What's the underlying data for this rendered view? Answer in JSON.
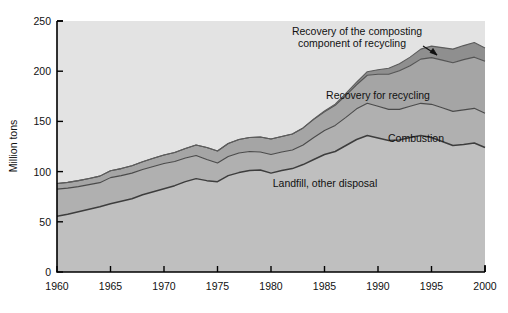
{
  "chart_data": {
    "type": "area",
    "stacked": true,
    "title": "",
    "subtitle": "",
    "xlabel": "",
    "ylabel": "Million tons",
    "xlim": [
      1960,
      2000
    ],
    "ylim": [
      0,
      250
    ],
    "grid": false,
    "legend_position": "inline-annotations",
    "x": [
      1960,
      1961,
      1962,
      1963,
      1964,
      1965,
      1966,
      1967,
      1968,
      1969,
      1970,
      1971,
      1972,
      1973,
      1974,
      1975,
      1976,
      1977,
      1978,
      1979,
      1980,
      1981,
      1982,
      1983,
      1984,
      1985,
      1986,
      1987,
      1988,
      1989,
      1990,
      1991,
      1992,
      1993,
      1994,
      1995,
      1996,
      1997,
      1998,
      1999,
      2000
    ],
    "x_ticks": [
      1960,
      1965,
      1970,
      1975,
      1980,
      1985,
      1990,
      1995,
      2000
    ],
    "x_tick_labels": [
      "1960",
      "1965",
      "1970",
      "1975",
      "1980",
      "1985",
      "1990",
      "1995",
      "2000"
    ],
    "y_ticks": [
      0,
      50,
      100,
      150,
      200,
      250
    ],
    "y_tick_labels": [
      "0",
      "50",
      "100",
      "150",
      "200",
      "250"
    ],
    "series": [
      {
        "name": "Landfill, other disposal",
        "label": "Landfill, other disposal",
        "color": "#bfbfbf",
        "line_color": "#3d3d3d",
        "values": [
          55.5,
          57.5,
          60.0,
          62.5,
          65.0,
          68.0,
          70.5,
          73.0,
          77.0,
          80.0,
          83.0,
          86.0,
          90.0,
          93.0,
          91.0,
          90.0,
          96.0,
          99.0,
          101.0,
          101.5,
          98.5,
          101.0,
          103.0,
          107.0,
          112.0,
          117.0,
          120.0,
          126.0,
          132.0,
          136.0,
          133.5,
          131.0,
          131.5,
          134.0,
          136.0,
          134.0,
          130.0,
          126.0,
          127.0,
          128.5,
          124.0
        ]
      },
      {
        "name": "Combustion",
        "label": "Combustion",
        "color": "#b0b0b0",
        "line_color": "#4a4a4a",
        "values": [
          27.0,
          26.0,
          25.0,
          24.5,
          24.0,
          26.0,
          25.5,
          25.5,
          25.0,
          25.0,
          25.0,
          24.0,
          23.5,
          23.0,
          21.0,
          18.5,
          19.0,
          19.5,
          19.0,
          18.0,
          18.5,
          18.5,
          18.5,
          19.5,
          22.0,
          24.0,
          26.0,
          28.0,
          30.5,
          32.0,
          31.5,
          31.0,
          30.5,
          31.0,
          32.0,
          33.0,
          33.5,
          34.0,
          34.5,
          34.5,
          34.0
        ]
      },
      {
        "name": "Recovery for recycling",
        "label": "Recovery for recycling",
        "color": "#a5a5a5",
        "line_color": "#545454",
        "values": [
          5.6,
          5.8,
          6.0,
          6.2,
          6.5,
          6.8,
          7.0,
          7.4,
          7.8,
          8.2,
          8.6,
          9.0,
          9.5,
          10.5,
          12.0,
          12.0,
          13.0,
          13.5,
          14.0,
          15.0,
          15.5,
          15.5,
          16.0,
          17.0,
          18.0,
          18.5,
          20.0,
          22.0,
          24.0,
          28.0,
          32.0,
          35.0,
          38.5,
          40.5,
          44.0,
          46.5,
          47.5,
          48.5,
          50.0,
          51.0,
          52.0
        ]
      },
      {
        "name": "Recovery of the composting component of recycling",
        "label": "Recovery of the composting component of recycling",
        "color": "#8f8f8f",
        "line_color": "#5c5c5c",
        "values": [
          0.0,
          0.0,
          0.0,
          0.0,
          0.0,
          0.0,
          0.0,
          0.0,
          0.0,
          0.0,
          0.0,
          0.0,
          0.0,
          0.0,
          0.0,
          0.0,
          0.0,
          0.0,
          0.0,
          0.0,
          0.0,
          0.0,
          0.0,
          0.0,
          0.5,
          0.8,
          1.2,
          1.8,
          2.5,
          3.5,
          4.5,
          6.0,
          7.0,
          8.5,
          10.0,
          11.5,
          12.5,
          13.5,
          14.0,
          14.5,
          13.0
        ]
      }
    ],
    "annotations": [
      {
        "name": "composting-annotation",
        "line1": "Recovery of the composting",
        "line2": "component of recycling",
        "has_arrow": true
      },
      {
        "name": "recycling-label",
        "text": "Recovery for recycling"
      },
      {
        "name": "combustion-label",
        "text": "Combustion"
      },
      {
        "name": "landfill-label",
        "text": "Landfill, other disposal"
      }
    ]
  },
  "axes": {
    "y_title": "Million tons",
    "plot_background": "#e3e3e3",
    "frame_color": "#000000"
  }
}
